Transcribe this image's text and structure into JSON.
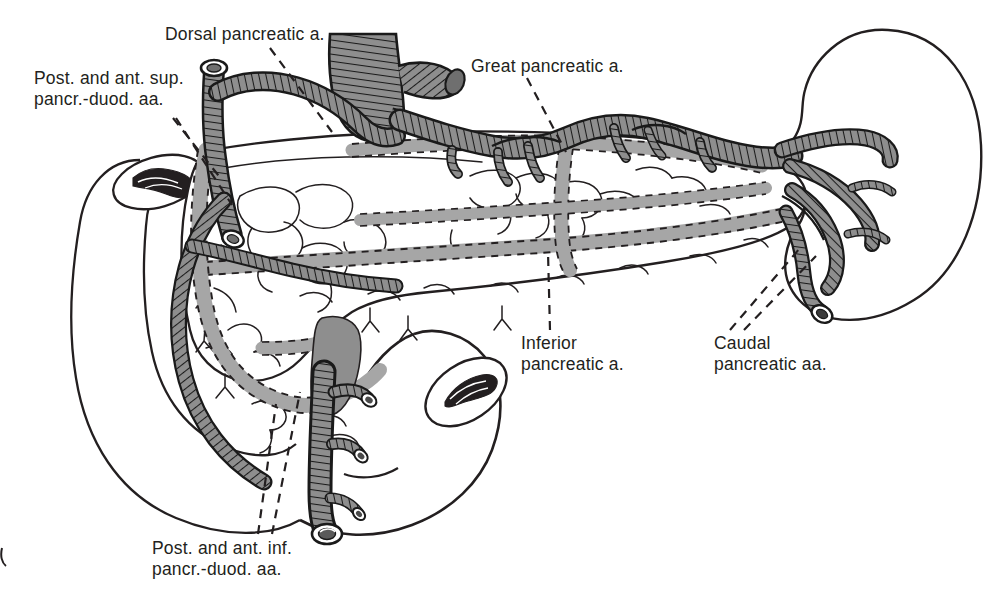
{
  "figure": {
    "background_color": "#ffffff",
    "ink_color": "#231f20",
    "vessel_fill": "#8e8e8e",
    "hidden_vessel_fill": "#a6a6a6",
    "spleen_stipple_color": "#2b2b2b"
  },
  "labels": {
    "dorsal_pancreatic": "Dorsal pancreatic a.",
    "post_ant_sup_pd": "Post. and ant. sup.\npancr.-duod. aa.",
    "great_pancreatic": "Great pancreatic a.",
    "inferior_pancreatic": "Inferior\npancreatic a.",
    "caudal_pancreatic": "Caudal\npancreatic aa.",
    "post_ant_inf_pd": "Post. and ant. inf.\npancr.-duod. aa."
  },
  "structures": [
    {
      "name": "spleen",
      "kind": "organ",
      "label": ""
    },
    {
      "name": "pancreas",
      "kind": "organ",
      "label": ""
    },
    {
      "name": "duodenum",
      "kind": "organ",
      "label": ""
    },
    {
      "name": "splenic-artery",
      "kind": "artery",
      "label": ""
    },
    {
      "name": "celiac-trunk",
      "kind": "artery",
      "label": ""
    },
    {
      "name": "gastroduodenal-artery",
      "kind": "artery",
      "label": ""
    },
    {
      "name": "superior-mesenteric-artery",
      "kind": "artery",
      "label": ""
    },
    {
      "name": "pancreaticoduodenal-arcade",
      "kind": "artery",
      "label": ""
    }
  ],
  "legend_note": {
    "solid_vessel": "hatched vessels lie anterior",
    "dashed_vessel": "dashed outline vessels lie posterior"
  }
}
